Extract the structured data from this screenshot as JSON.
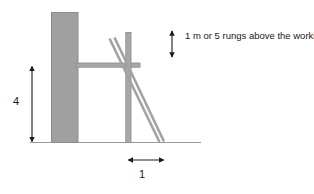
{
  "diagram": {
    "colors": {
      "wall_fill": "#a0a0a0",
      "wall_stroke": "#8a8a8a",
      "member_fill": "#a8a8a8",
      "member_stroke": "#8f8f8f",
      "ground_stroke": "#9a9a9a",
      "dimension_stroke": "#1a1a1a",
      "text": "#1a1a1a",
      "background": "#ffffff"
    },
    "elements": {
      "wall_name": "building wall",
      "ground_name": "ground line",
      "platform_name": "working platform",
      "post_name": "scaffold standard",
      "ladder_name": "access ladder"
    }
  },
  "dimensions": {
    "height": {
      "value": "4",
      "name": "wall height dimension",
      "orientation": "vertical"
    },
    "width": {
      "value": "1",
      "name": "ladder base offset dimension",
      "orientation": "horizontal"
    }
  },
  "callout": {
    "arrow_name": "ladder extension dimension arrow",
    "text": "1 m or 5 rungs above the working platform"
  }
}
